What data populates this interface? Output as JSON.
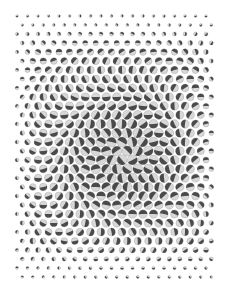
{
  "image": {
    "description": "Op-art halftone pattern of shaded spheres on a hexagonal grid with a spiral swirl at center",
    "width": 236,
    "height": 296,
    "background": "#ffffff",
    "dark": "#4a4a4a",
    "light": "#d8d8d8",
    "grid": {
      "x_start": 17,
      "x_end": 216,
      "y_start": 16,
      "y_end": 278,
      "col_spacing": 10.5,
      "row_spacing": 9,
      "center_x": 125,
      "center_y": 155,
      "max_radius": 5.2,
      "min_radius": 1.0
    }
  }
}
